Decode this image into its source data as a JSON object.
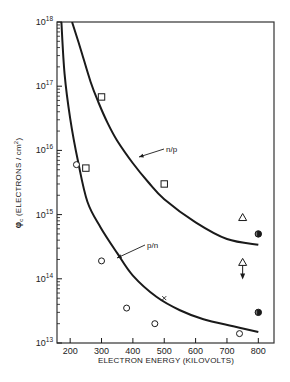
{
  "chart_data": {
    "type": "line",
    "title": "",
    "xlabel": "ELECTRON ENERGY (KILOVOLTS)",
    "ylabel": "φc (ELECTRONS / cm²)",
    "ylabel_symbol": "φ",
    "ylabel_subscript": "c",
    "ylabel_text": " (ELECTRONS / cm",
    "ylabel_sup": "2",
    "ylabel_close": ")",
    "xlim": [
      158,
      850
    ],
    "ylim_log10": [
      13,
      18
    ],
    "yscale": "log",
    "grid": false,
    "x_ticks": [
      200,
      300,
      400,
      500,
      600,
      700,
      800
    ],
    "y_ticks": [
      {
        "base": "10",
        "exp": "13",
        "log": 13
      },
      {
        "base": "10",
        "exp": "14",
        "log": 14
      },
      {
        "base": "10",
        "exp": "15",
        "log": 15
      },
      {
        "base": "10",
        "exp": "16",
        "log": 16
      },
      {
        "base": "10",
        "exp": "17",
        "log": 17
      },
      {
        "base": "10",
        "exp": "18",
        "log": 18
      }
    ],
    "series": [
      {
        "name": "n/p",
        "kind": "curve",
        "points_log10": [
          [
            206,
            18.0
          ],
          [
            232,
            17.6
          ],
          [
            265,
            17.07
          ],
          [
            290,
            16.75
          ],
          [
            320,
            16.42
          ],
          [
            350,
            16.15
          ],
          [
            400,
            15.8
          ],
          [
            450,
            15.5
          ],
          [
            500,
            15.24
          ],
          [
            600,
            14.88
          ],
          [
            700,
            14.62
          ],
          [
            800,
            14.53
          ]
        ]
      },
      {
        "name": "p/n",
        "kind": "curve",
        "points_log10": [
          [
            172,
            18.0
          ],
          [
            182,
            17.2
          ],
          [
            200,
            16.5
          ],
          [
            225,
            15.83
          ],
          [
            255,
            15.2
          ],
          [
            297,
            14.8
          ],
          [
            350,
            14.4
          ],
          [
            400,
            14.05
          ],
          [
            475,
            13.72
          ],
          [
            550,
            13.51
          ],
          [
            625,
            13.37
          ],
          [
            720,
            13.26
          ],
          [
            800,
            13.17
          ]
        ]
      },
      {
        "name": "open squares",
        "kind": "markers",
        "marker": "square",
        "points": [
          [
            300,
            6.8e+16
          ],
          [
            250,
            5300000000000000.0
          ],
          [
            500,
            3000000000000000.0
          ]
        ]
      },
      {
        "name": "open circles",
        "kind": "markers",
        "marker": "circle",
        "points": [
          [
            220,
            6000000000000000.0
          ],
          [
            300,
            190000000000000.0
          ],
          [
            380,
            35000000000000.0
          ],
          [
            470,
            20000000000000.0
          ],
          [
            740,
            14000000000000.0
          ]
        ]
      },
      {
        "name": "cross",
        "kind": "markers",
        "marker": "x",
        "points": [
          [
            500,
            50000000000000.0
          ]
        ]
      },
      {
        "name": "open triangles",
        "kind": "markers",
        "marker": "triangle",
        "points": [
          [
            750,
            900000000000000.0
          ]
        ]
      },
      {
        "name": "triangle upper limit",
        "kind": "markers",
        "marker": "triangle-down-arrow",
        "points": [
          [
            750,
            180000000000000.0
          ]
        ]
      },
      {
        "name": "half-filled circles",
        "kind": "markers",
        "marker": "half-filled-circle",
        "points": [
          [
            800,
            500000000000000.0
          ],
          [
            800,
            30000000000000.0
          ]
        ]
      }
    ],
    "annotations": [
      {
        "text": "n/p",
        "label_x": 166,
        "label_y": 152,
        "arrow_to": [
          139,
          157
        ]
      },
      {
        "text": "p/n",
        "label_x": 147,
        "label_y": 248,
        "arrow_to": [
          117,
          258
        ]
      }
    ]
  }
}
